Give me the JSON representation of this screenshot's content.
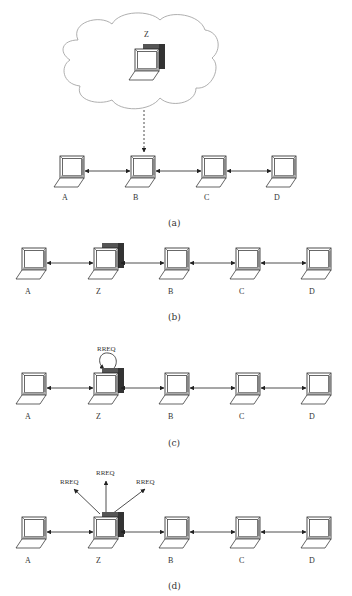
{
  "figure": {
    "panels": [
      {
        "caption": "(a)",
        "cloud_node": "Z",
        "nodes": [
          "A",
          "B",
          "C",
          "D"
        ],
        "note": "Node Z (cloud/attacker) attaches to B via dashed arrow"
      },
      {
        "caption": "(b)",
        "nodes": [
          "A",
          "Z",
          "B",
          "C",
          "D"
        ]
      },
      {
        "caption": "(c)",
        "nodes": [
          "A",
          "Z",
          "B",
          "C",
          "D"
        ],
        "message": "RREQ"
      },
      {
        "caption": "(d)",
        "nodes": [
          "A",
          "Z",
          "B",
          "C",
          "D"
        ],
        "messages": [
          "RREQ",
          "RREQ",
          "RREQ"
        ]
      }
    ]
  },
  "colors": {
    "line": "#222222",
    "shadow": "#555555",
    "cloud": "#9a9a9a"
  }
}
